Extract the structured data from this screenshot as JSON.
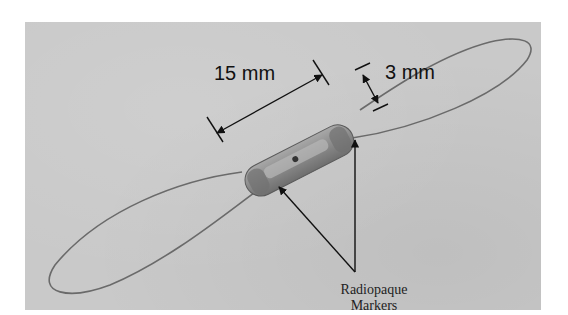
{
  "figure": {
    "background_color": "#c9c9c9",
    "annotations": {
      "length_label": "15 mm",
      "diameter_label": "3 mm",
      "markers_label_line1": "Radiopaque",
      "markers_label_line2": "Markers"
    }
  }
}
